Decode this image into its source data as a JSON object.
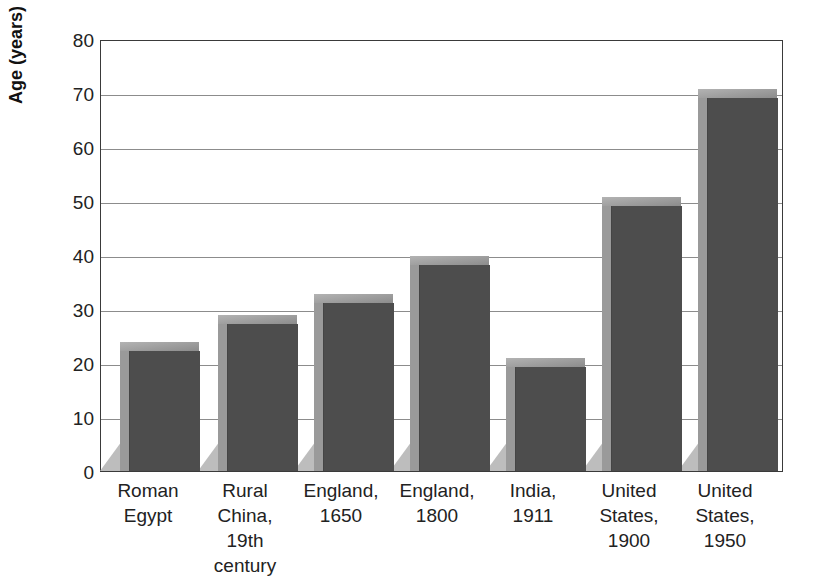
{
  "chart_data": {
    "type": "bar",
    "title": "",
    "subtitle": "",
    "xlabel": "",
    "ylabel": "Age (years)",
    "ylim": [
      0,
      80
    ],
    "yticks": [
      0,
      10,
      20,
      30,
      40,
      50,
      60,
      70,
      80
    ],
    "ytick_labels": [
      "0",
      "10",
      "20",
      "30",
      "40",
      "50",
      "60",
      "70",
      "80"
    ],
    "grid": true,
    "legend": false,
    "legend_position": "none",
    "style_3d": true,
    "bar_color": "#4d4d4d",
    "bar_side_color": "#9a9a9a",
    "bar_top_color": "#8f8f8f",
    "gridline_color": "#8c8c8c",
    "axis_color": "#3a3a3a",
    "background_color": "#ffffff",
    "categories": [
      "Roman\nEgypt",
      "Rural\nChina,\n19th century",
      "England,\n1650",
      "England,\n1800",
      "India,\n1911",
      "United\nStates,\n1900",
      "United\nStates,\n1950"
    ],
    "values": [
      24,
      29,
      33,
      40,
      21,
      51,
      71
    ],
    "value_labels": [
      "24",
      "29",
      "33",
      "40",
      "21",
      "51",
      "71"
    ],
    "unit": "years"
  }
}
